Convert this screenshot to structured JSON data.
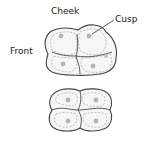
{
  "labels": {
    "cheek": "Cheek",
    "cusp": "Cusp",
    "front": "Front"
  },
  "colors": {
    "outline": "#444444",
    "fill": "#f6f6f6",
    "cusp_dot": "#b5b5b5",
    "text": "#222222"
  }
}
